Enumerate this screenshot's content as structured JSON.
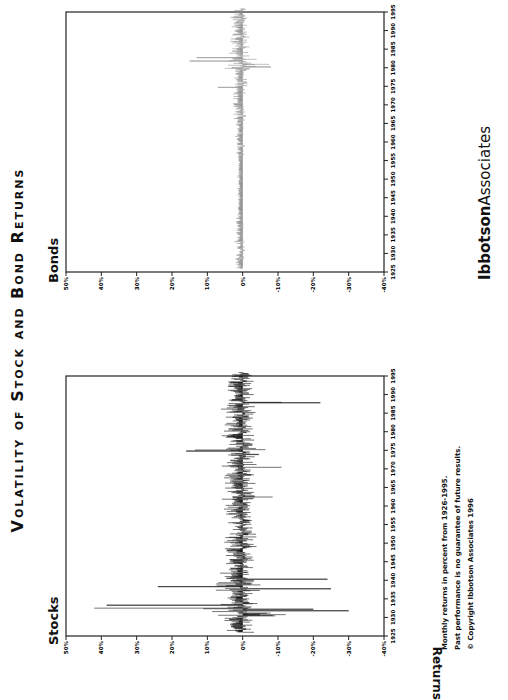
{
  "title": "Volatility of Stock and Bond Returns",
  "y_axis_label": "Returns",
  "panels": {
    "stocks": {
      "label": "Stocks",
      "color": "#000000"
    },
    "bonds": {
      "label": "Bonds",
      "color": "#8a8a8a"
    }
  },
  "footnotes": {
    "line1": "Monthly returns in percent from 1926-1995.",
    "line2": "Past performance is no guarantee of future results.",
    "line3": "© Copyright Ibbotson Associates 1996"
  },
  "brand": {
    "bold": "Ibbotson",
    "light": "Associates"
  },
  "chart_data": [
    {
      "type": "bar",
      "title": "Stocks",
      "xlabel": "",
      "ylabel": "Returns",
      "ylim": [
        -40,
        50
      ],
      "yticks": [
        "50%",
        "40%",
        "30%",
        "20%",
        "10%",
        "0%",
        "-10%",
        "-20%",
        "-30%",
        "-40%"
      ],
      "xticks": [
        "1925",
        "1930",
        "1935",
        "1940",
        "1945",
        "1950",
        "1955",
        "1960",
        "1965",
        "1970",
        "1975",
        "1980",
        "1985",
        "1990",
        "1995"
      ],
      "x_range": [
        1926,
        1995
      ],
      "grid": false,
      "notable_points": [
        {
          "period": "1929-1933",
          "range_pct": [
            -30,
            42
          ],
          "note": "extreme volatility during the Great Depression; max ~+42%, min ~-30%"
        },
        {
          "period": "1937-1939",
          "range_pct": [
            -25,
            25
          ]
        },
        {
          "period": "1987",
          "range_pct": [
            -22,
            13
          ],
          "note": "October 1987 crash ~-22%"
        },
        {
          "period": "1974-1975",
          "range_pct": [
            -12,
            16
          ]
        }
      ],
      "typical_range_pct": [
        -10,
        10
      ]
    },
    {
      "type": "bar",
      "title": "Bonds",
      "xlabel": "",
      "ylabel": "Returns",
      "ylim": [
        -40,
        50
      ],
      "yticks": [
        "50%",
        "40%",
        "30%",
        "20%",
        "10%",
        "0%",
        "-10%",
        "-20%",
        "-30%",
        "-40%"
      ],
      "xticks": [
        "1925",
        "1930",
        "1935",
        "1940",
        "1945",
        "1950",
        "1955",
        "1960",
        "1965",
        "1970",
        "1975",
        "1980",
        "1985",
        "1990",
        "1995"
      ],
      "x_range": [
        1926,
        1995
      ],
      "grid": false,
      "notable_points": [
        {
          "period": "1979-1982",
          "range_pct": [
            -8,
            15
          ],
          "note": "highest bond volatility; max ~+15%"
        },
        {
          "period": "1926-1940",
          "range_pct": [
            -3,
            4
          ]
        },
        {
          "period": "1941-1955",
          "range_pct": [
            -2,
            2
          ]
        }
      ],
      "typical_range_pct": [
        -3,
        3
      ]
    }
  ]
}
